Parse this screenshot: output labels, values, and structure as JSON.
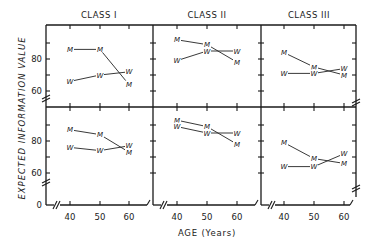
{
  "chart_data": {
    "type": "line",
    "title": "",
    "xlabel": "AGE (Years)",
    "ylabel": "EXPECTED INFORMATION VALUE",
    "x": [
      40,
      50,
      60
    ],
    "x_tick_labels": [
      "40",
      "50",
      "60"
    ],
    "y_tick_labels": [
      "80",
      "60",
      "80",
      "60",
      "0"
    ],
    "ylim": [
      0,
      100
    ],
    "grid": false,
    "legend": "markers M (men) and W (women) plotted directly",
    "panels": [
      {
        "column": "CLASS I",
        "row": "top",
        "series": [
          {
            "name": "M",
            "values": [
              86,
              86,
              64
            ]
          },
          {
            "name": "W",
            "values": [
              66,
              70,
              72
            ]
          }
        ]
      },
      {
        "column": "CLASS II",
        "row": "top",
        "series": [
          {
            "name": "M",
            "values": [
              92,
              89,
              78
            ]
          },
          {
            "name": "W",
            "values": [
              79,
              85,
              85
            ]
          }
        ]
      },
      {
        "column": "CLASS III",
        "row": "top",
        "series": [
          {
            "name": "M",
            "values": [
              84,
              75,
              70
            ]
          },
          {
            "name": "W",
            "values": [
              71,
              71,
              74
            ]
          }
        ]
      },
      {
        "column": "CLASS I",
        "row": "bottom",
        "series": [
          {
            "name": "M",
            "values": [
              87,
              84,
              73
            ]
          },
          {
            "name": "W",
            "values": [
              76,
              74,
              77
            ]
          }
        ]
      },
      {
        "column": "CLASS II",
        "row": "bottom",
        "series": [
          {
            "name": "M",
            "values": [
              93,
              89,
              78
            ]
          },
          {
            "name": "W",
            "values": [
              89,
              85,
              85
            ]
          }
        ]
      },
      {
        "column": "CLASS III",
        "row": "bottom",
        "series": [
          {
            "name": "M",
            "values": [
              79,
              69,
              66
            ]
          },
          {
            "name": "W",
            "values": [
              64,
              64,
              72
            ]
          }
        ]
      }
    ]
  },
  "columns": [
    "CLASS I",
    "CLASS II",
    "CLASS III"
  ],
  "labels": {
    "ylabel": "EXPECTED  INFORMATION  VALUE",
    "xlabel": "AGE (Years)",
    "y80": "80",
    "y60": "60",
    "y0": "0",
    "x40": "40",
    "x50": "50",
    "x60": "60"
  },
  "colors": {
    "ink": "#1a1a1a",
    "background": "#ffffff"
  }
}
